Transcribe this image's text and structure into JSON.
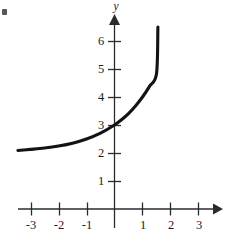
{
  "figure": {
    "corner_mark": "·",
    "background_color": "#ffffff",
    "ink_color": "#131313",
    "axis_color": "#2b2b2b"
  },
  "chart_data": {
    "type": "line",
    "title": "",
    "subtitle": "",
    "xlabel": "",
    "ylabel": "y",
    "xlim": [
      -3.55,
      3.9
    ],
    "ylim": [
      -0.55,
      7.4
    ],
    "grid": false,
    "legend": null,
    "x_ticks": [
      -3,
      -2,
      -1,
      1,
      2,
      3
    ],
    "x_tick_labels": [
      "-3",
      "-2",
      "-1",
      "1",
      "2",
      "3"
    ],
    "y_ticks": [
      1,
      2,
      3,
      4,
      5,
      6
    ],
    "y_tick_labels": [
      "1",
      "2",
      "3",
      "4",
      "5",
      "6"
    ],
    "asymptote": 2,
    "y_intercept": 3,
    "series": [
      {
        "name": "exponential-curve",
        "color": "#131313",
        "x": [
          -3.45,
          -3.0,
          -2.5,
          -2.0,
          -1.5,
          -1.0,
          -0.5,
          0.0,
          0.25,
          0.5,
          0.75,
          1.0,
          1.25,
          1.5,
          1.55
        ],
        "y": [
          2.09,
          2.13,
          2.18,
          2.25,
          2.35,
          2.5,
          2.71,
          3.0,
          3.19,
          3.41,
          3.68,
          4.0,
          4.38,
          4.83,
          6.5
        ]
      }
    ],
    "annotations": []
  }
}
